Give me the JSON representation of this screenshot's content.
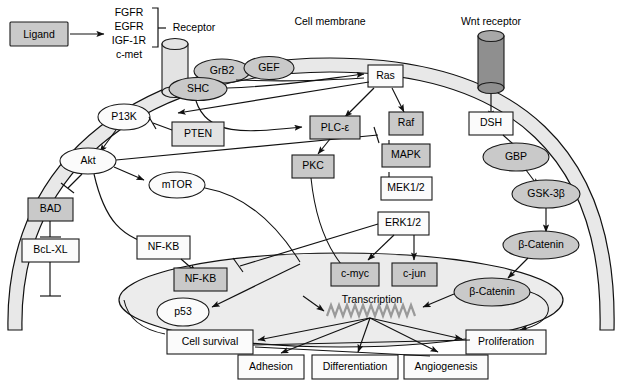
{
  "figure": {
    "type": "signaling-pathway-diagram",
    "labels": {
      "cell_membrane": "Cell membrane",
      "receptor": "Receptor",
      "wnt_receptor": "Wnt receptor",
      "transcription": "Transcription"
    },
    "receptor_list": [
      "FGFR",
      "EGFR",
      "IGF-1R",
      "c-met"
    ],
    "nodes": {
      "ligand": "Ligand",
      "grb2": "GrB2",
      "gef": "GEF",
      "shc": "SHC",
      "ras": "Ras",
      "pi3k": "P13K",
      "pten": "PTEN",
      "akt": "Akt",
      "mtor": "mTOR",
      "bad": "BAD",
      "bclxl": "BcL-XL",
      "plce": "PLC-ε",
      "pkc": "PKC",
      "raf": "Raf",
      "mapk": "MAPK",
      "mek": "MEK1/2",
      "erk": "ERK1/2",
      "nfkb_cyto": "NF-KB",
      "nfkb_nuc": "NF-KB",
      "p53": "p53",
      "cmyc": "c-myc",
      "cjun": "c-jun",
      "dsh": "DSH",
      "gbp": "GBP",
      "gsk3b": "GSK-3β",
      "bcatenin_cyto": "β-Catenin",
      "bcatenin_nuc": "β-Catenin"
    },
    "outcomes": {
      "cell_survival": "Cell survival",
      "adhesion": "Adhesion",
      "differentiation": "Differentiation",
      "angiogenesis": "Angiogenesis",
      "proliferation": "Proliferation"
    },
    "colors": {
      "node_gray": "#c9c9c9",
      "node_white": "#fbfbfb",
      "membrane": "#e8e8e8",
      "nucleus": "#ececec",
      "dna": "#9a9a9a",
      "stroke": "#1a1a1a"
    }
  }
}
